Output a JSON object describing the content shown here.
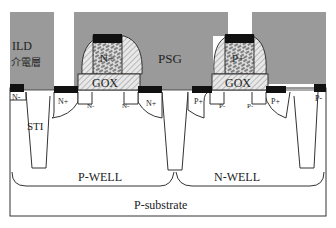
{
  "diagram": {
    "type": "CMOS cross-section",
    "colors": {
      "ild": "#9a9a9a",
      "metal": "#111111",
      "gox": "#d4d4d4",
      "line": "#333333",
      "background": "#ffffff"
    },
    "layers": {
      "ild_label": "ILD",
      "ild_chinese": "介電層",
      "psg_label": "PSG",
      "gox_left": "GOX",
      "gox_right": "GOX",
      "sti_label": "STI",
      "pwell_label": "P-WELL",
      "nwell_label": "N-WELL",
      "substrate_label": "P-substrate"
    },
    "nmos": {
      "gate_label": "N+",
      "source_label": "N+",
      "drain_label": "N+",
      "ldd_left": "N-",
      "ldd_right": "N-",
      "edge_label": "N-"
    },
    "pmos": {
      "gate_label": "P+",
      "source_label": "P+",
      "drain_label": "P+",
      "ldd_left": "P-",
      "ldd_right": "P-",
      "edge_label": "P-"
    }
  }
}
